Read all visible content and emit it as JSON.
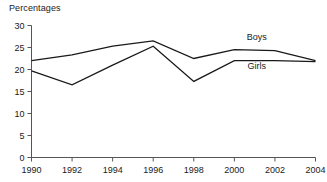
{
  "chart_data": {
    "type": "line",
    "title": "Percentages",
    "xlabel": "",
    "ylabel": "",
    "x": [
      1990,
      1992,
      1994,
      1996,
      1998,
      2000,
      2002,
      2004
    ],
    "xtick_labels": [
      "1990",
      "1992",
      "1994",
      "1996",
      "1998",
      "2000",
      "2002",
      "2004"
    ],
    "ytick_labels": [
      "0",
      "5",
      "10",
      "15",
      "20",
      "25",
      "30"
    ],
    "yticks": [
      0,
      5,
      10,
      15,
      20,
      25,
      30
    ],
    "ylim": [
      0,
      30
    ],
    "xlim": [
      1990,
      2004
    ],
    "grid": false,
    "legend_position": "inline-annotations",
    "series": [
      {
        "name": "Boys",
        "color": "#1a1a1a",
        "values": [
          22.0,
          23.3,
          25.3,
          26.5,
          22.5,
          24.5,
          24.3,
          22.0
        ]
      },
      {
        "name": "Girls",
        "color": "#1a1a1a",
        "values": [
          19.7,
          16.5,
          21.0,
          25.3,
          17.3,
          22.0,
          22.0,
          21.8
        ]
      }
    ],
    "annotations": [
      {
        "text": "Boys",
        "x": 2001.1,
        "y": 26.6
      },
      {
        "text": "Girls",
        "x": 2001.1,
        "y": 20.1
      }
    ]
  }
}
